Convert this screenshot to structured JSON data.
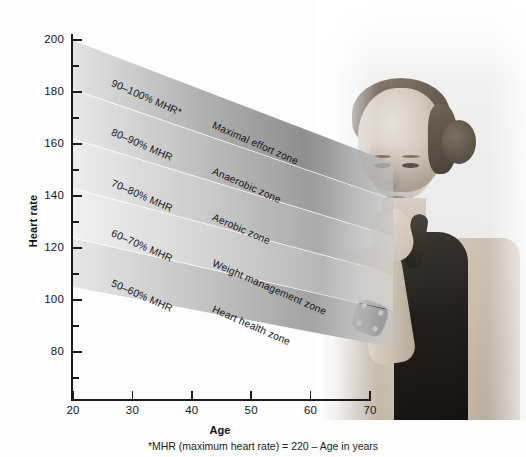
{
  "figure": {
    "y_axis_title": "Heart rate",
    "x_axis_title": "Age",
    "footnote": "*MHR (maximum heart rate) = 220 – Age in years"
  },
  "chart_data": {
    "type": "area",
    "title": "",
    "xlabel": "Age",
    "ylabel": "Heart rate",
    "xlim": [
      20,
      70
    ],
    "ylim": [
      70,
      205
    ],
    "xticks": [
      20,
      30,
      40,
      50,
      60,
      70
    ],
    "yticks": [
      80,
      100,
      120,
      140,
      160,
      180,
      200
    ],
    "y_minor_ticks": [
      70,
      90,
      110,
      130,
      150,
      170,
      190
    ],
    "grid": false,
    "legend": "none",
    "formula": "MHR = 220 - Age",
    "note": "Each band spans a percentage range of MHR; MHR declines linearly from 200 bpm at age 20 to 150 bpm at age 70.",
    "bands": [
      {
        "percent_label": "90–100% MHR*",
        "zone_label": "Maximal effort zone",
        "pct_low": 90,
        "pct_high": 100,
        "hr_at_age20": [
          180,
          200
        ],
        "hr_at_age70": [
          135,
          150
        ],
        "shade": "#9a9a9a"
      },
      {
        "percent_label": "80–90% MHR",
        "zone_label": "Anaerobic zone",
        "pct_low": 80,
        "pct_high": 90,
        "hr_at_age20": [
          160,
          180
        ],
        "hr_at_age70": [
          120,
          135
        ],
        "shade": "#a8a8a8"
      },
      {
        "percent_label": "70–80% MHR",
        "zone_label": "Aerobic zone",
        "pct_low": 70,
        "pct_high": 80,
        "hr_at_age20": [
          140,
          160
        ],
        "hr_at_age70": [
          105,
          120
        ],
        "shade": "#b6b6b6"
      },
      {
        "percent_label": "60–70% MHR",
        "zone_label": "Weight management zone",
        "pct_low": 60,
        "pct_high": 70,
        "hr_at_age20": [
          120,
          140
        ],
        "hr_at_age70": [
          90,
          105
        ],
        "shade": "#c2c2c2"
      },
      {
        "percent_label": "50–60% MHR",
        "zone_label": "Heart health zone",
        "pct_low": 50,
        "pct_high": 60,
        "hr_at_age20": [
          100,
          120
        ],
        "hr_at_age70": [
          75,
          90
        ],
        "shade": "#b0b0b0"
      }
    ]
  },
  "photo": {
    "alt": "grayscale photo of a woman in a black tank top checking a heart-rate watch on her wrist"
  }
}
